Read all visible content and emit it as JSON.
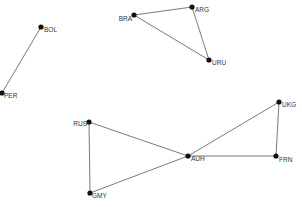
{
  "diagram": {
    "type": "network-graph",
    "background": "#ffffff",
    "node_color": "#111111",
    "edge_color": "#6b6b6b",
    "nodes": [
      {
        "id": "BOL",
        "label": "BOL",
        "x": 41,
        "y": 27,
        "lx": 3,
        "ly": 5,
        "anchor": "start"
      },
      {
        "id": "PER",
        "label": "PER",
        "x": 2,
        "y": 93,
        "lx": 2,
        "ly": 5,
        "anchor": "start"
      },
      {
        "id": "BRA",
        "label": "BRA",
        "x": 134,
        "y": 15,
        "lx": -2,
        "ly": 6,
        "anchor": "end"
      },
      {
        "id": "ARG",
        "label": "ARG",
        "x": 192,
        "y": 7,
        "lx": 3,
        "ly": 5,
        "anchor": "start"
      },
      {
        "id": "URU",
        "label": "URU",
        "x": 209,
        "y": 60,
        "lx": 3,
        "ly": 5,
        "anchor": "start"
      },
      {
        "id": "RUS",
        "label": "RUS",
        "x": 89,
        "y": 122,
        "lx": -2,
        "ly": 4,
        "anchor": "end"
      },
      {
        "id": "GMY",
        "label": "GMY",
        "x": 90,
        "y": 193,
        "lx": 2,
        "ly": 5,
        "anchor": "start"
      },
      {
        "id": "AUH",
        "label": "AUH",
        "x": 188,
        "y": 156,
        "lx": 3,
        "ly": 5,
        "anchor": "start"
      },
      {
        "id": "UKG",
        "label": "UKG",
        "x": 279,
        "y": 102,
        "lx": 3,
        "ly": 5,
        "anchor": "start"
      },
      {
        "id": "FRN",
        "label": "FRN",
        "x": 276,
        "y": 156,
        "lx": 3,
        "ly": 6,
        "anchor": "start"
      }
    ],
    "edges": [
      [
        "BOL",
        "PER"
      ],
      [
        "BRA",
        "ARG"
      ],
      [
        "BRA",
        "URU"
      ],
      [
        "ARG",
        "URU"
      ],
      [
        "RUS",
        "GMY"
      ],
      [
        "RUS",
        "AUH"
      ],
      [
        "GMY",
        "AUH"
      ],
      [
        "AUH",
        "UKG"
      ],
      [
        "AUH",
        "FRN"
      ],
      [
        "UKG",
        "FRN"
      ]
    ]
  }
}
